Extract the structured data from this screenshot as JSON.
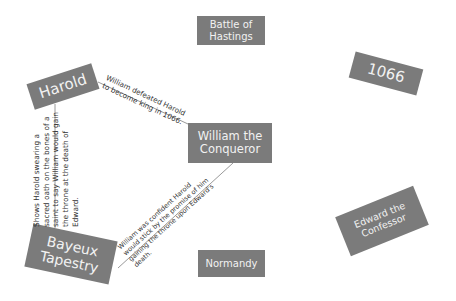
{
  "diagram": {
    "type": "concept-map",
    "box_color": "#7b7b7b",
    "text_color": "#f2f2f2",
    "nodes": {
      "battle": {
        "label_line1": "Battle of",
        "label_line2": "Hastings"
      },
      "year": {
        "label": "1066"
      },
      "harold": {
        "label": "Harold"
      },
      "william": {
        "label_line1": "William the",
        "label_line2": "Conqueror"
      },
      "bayeux": {
        "label_line1": "Bayeux",
        "label_line2": "Tapestry"
      },
      "normandy": {
        "label": "Normandy"
      },
      "edward": {
        "label_line1": "Edward the",
        "label_line2": "Confessor"
      }
    },
    "edges": {
      "harold_william": {
        "from": "Harold",
        "to": "William the Conqueror",
        "line1": "William defeated Harold",
        "line2": "to become king in 1066."
      },
      "harold_bayeux": {
        "from": "Harold",
        "to": "Bayeux Tapestry",
        "line1": "Shows Harold swearing a",
        "line2": "sacred oath on the bones of a",
        "line3": "saint to say William would gain",
        "line4": "the throne at the death of",
        "line5": "Edward."
      },
      "bayeux_william": {
        "from": "Bayeux Tapestry",
        "to": "William the Conqueror",
        "line1": "William was confident Harold",
        "line2": "would stick by the promise of him",
        "line3": "gaining the throne upon Edward's",
        "line4": "death."
      }
    }
  }
}
